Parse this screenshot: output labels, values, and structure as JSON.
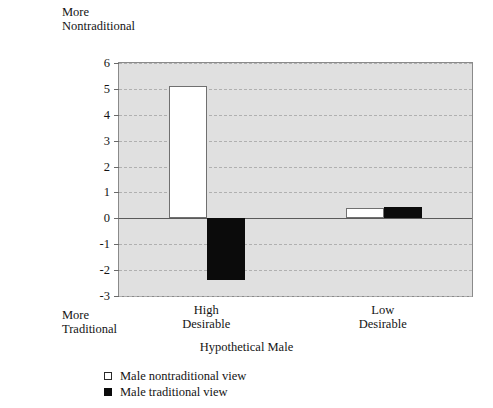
{
  "annotations": {
    "top_note": "More\nNontraditional",
    "bottom_note": "More\nTraditional"
  },
  "legend": {
    "items": [
      {
        "label": "Male nontraditional view",
        "swatch": "white-square-icon",
        "color": "#ffffff"
      },
      {
        "label": "Male traditional view",
        "swatch": "black-square-icon",
        "color": "#0b0b0b"
      }
    ]
  },
  "chart_data": {
    "type": "bar",
    "title": "",
    "subtitle": "",
    "xlabel": "Hypothetical Male",
    "ylabel": "",
    "categories": [
      "High\nDesirable",
      "Low\nDesirable"
    ],
    "category_labels_flat": [
      "High Desirable",
      "Low Desirable"
    ],
    "series": [
      {
        "name": "Male nontraditional view",
        "color": "#ffffff",
        "values": [
          5.1,
          0.4
        ]
      },
      {
        "name": "Male traditional view",
        "color": "#0b0b0b",
        "values": [
          -2.4,
          0.45
        ]
      }
    ],
    "ylim": [
      -3,
      6
    ],
    "yticks": [
      6,
      5,
      4,
      3,
      2,
      1,
      0,
      -1,
      -2,
      -3
    ],
    "ytick_labels": [
      "6",
      "5",
      "4",
      "3",
      "2",
      "1",
      "0",
      "-1",
      "-2",
      "-3"
    ],
    "grid": true,
    "grid_style": "dashed-horizontal",
    "zero_line": 0,
    "legend_position": "below-left",
    "plot_background": "#e0e0e0",
    "annotations": [
      "More Nontraditional (top of axis)",
      "More Traditional (bottom of axis)"
    ]
  }
}
